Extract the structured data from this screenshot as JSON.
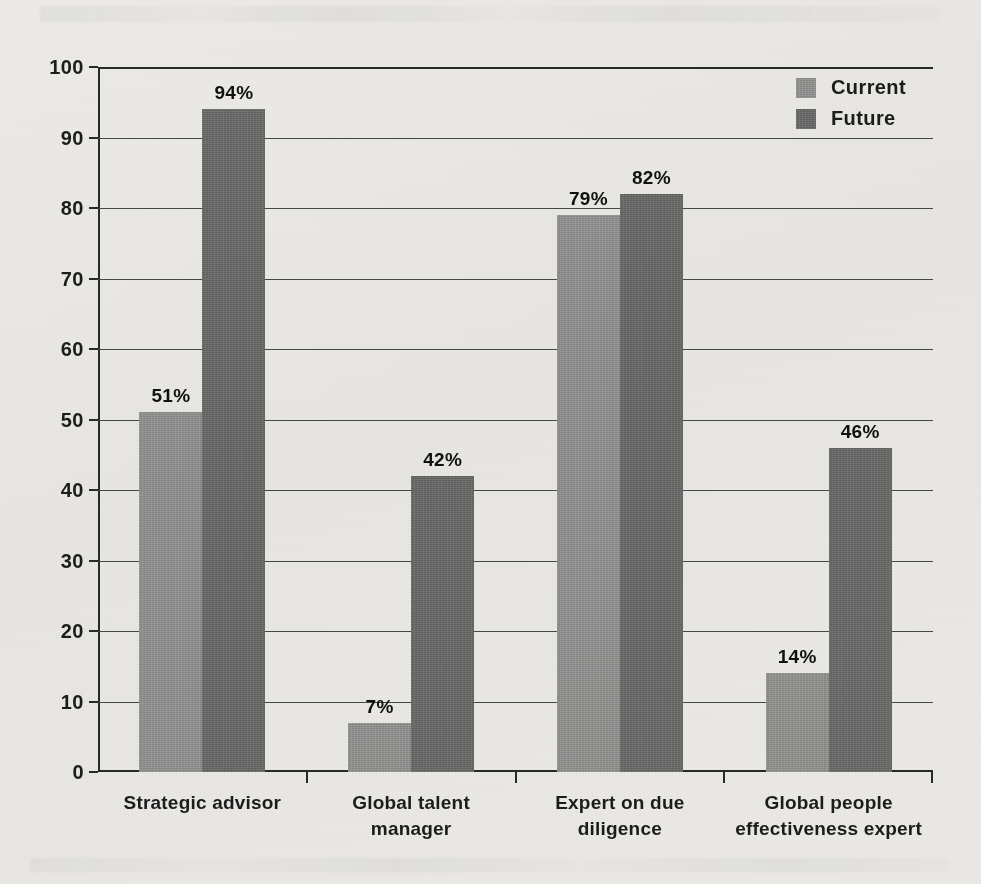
{
  "chart_data": {
    "type": "bar",
    "title": "",
    "subtitle": "",
    "xlabel": "",
    "ylabel": "",
    "ylim": [
      0,
      100
    ],
    "ytick_labels": [
      "0",
      "10",
      "20",
      "30",
      "40",
      "50",
      "60",
      "70",
      "80",
      "90",
      "100"
    ],
    "ytick_values": [
      0,
      10,
      20,
      30,
      40,
      50,
      60,
      70,
      80,
      90,
      100
    ],
    "grid": true,
    "legend_position": "top-right",
    "value_label_suffix": "%",
    "categories": [
      "Strategic advisor",
      "Global talent manager",
      "Expert on due diligence",
      "Global people effectiveness expert"
    ],
    "category_lines": [
      [
        "Strategic advisor"
      ],
      [
        "Global talent",
        "manager"
      ],
      [
        "Expert on due",
        "diligence"
      ],
      [
        "Global people",
        "effectiveness expert"
      ]
    ],
    "series": [
      {
        "name": "Current",
        "color": "#9a9a9a",
        "values": [
          51,
          7,
          79,
          14
        ],
        "value_labels": [
          "51%",
          "7%",
          "79%",
          "14%"
        ]
      },
      {
        "name": "Future",
        "color": "#6e6e6e",
        "values": [
          94,
          42,
          82,
          46
        ],
        "value_labels": [
          "94%",
          "42%",
          "82%",
          "46%"
        ]
      }
    ]
  },
  "legend": {
    "items": [
      {
        "label": "Current",
        "color": "#9a9a9a"
      },
      {
        "label": "Future",
        "color": "#6e6e6e"
      }
    ]
  },
  "colors": {
    "background": "#f4f3f1",
    "axis": "#2b2b2b",
    "gridline": "#4a4a4a",
    "text": "#1d1d1d",
    "current_bar": "#9a9a9a",
    "future_bar": "#6e6e6e"
  }
}
